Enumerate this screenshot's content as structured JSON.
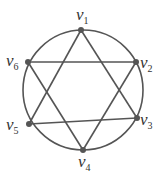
{
  "diagram": {
    "type": "graph",
    "colors": {
      "stroke": "#555555",
      "vertex": "#555555",
      "label": "#333333",
      "background": "#ffffff"
    },
    "circle": {
      "cx": 83,
      "cy": 90,
      "r": 60
    },
    "vertices": [
      {
        "id": "v1",
        "base": "v",
        "sub": "1",
        "x": 81,
        "y": 30,
        "lx": 76,
        "ly": 20
      },
      {
        "id": "v2",
        "base": "v",
        "sub": "2",
        "x": 136,
        "y": 62,
        "lx": 140,
        "ly": 68
      },
      {
        "id": "v3",
        "base": "v",
        "sub": "3",
        "x": 137,
        "y": 118,
        "lx": 140,
        "ly": 125
      },
      {
        "id": "v4",
        "base": "v",
        "sub": "4",
        "x": 83,
        "y": 150,
        "lx": 78,
        "ly": 167
      },
      {
        "id": "v5",
        "base": "v",
        "sub": "5",
        "x": 29,
        "y": 124,
        "lx": 6,
        "ly": 130
      },
      {
        "id": "v6",
        "base": "v",
        "sub": "6",
        "x": 28,
        "y": 62,
        "lx": 6,
        "ly": 66
      }
    ],
    "edges": [
      [
        "v1",
        "v5"
      ],
      [
        "v1",
        "v3"
      ],
      [
        "v6",
        "v2"
      ],
      [
        "v6",
        "v4"
      ],
      [
        "v2",
        "v4"
      ],
      [
        "v5",
        "v3"
      ]
    ]
  }
}
